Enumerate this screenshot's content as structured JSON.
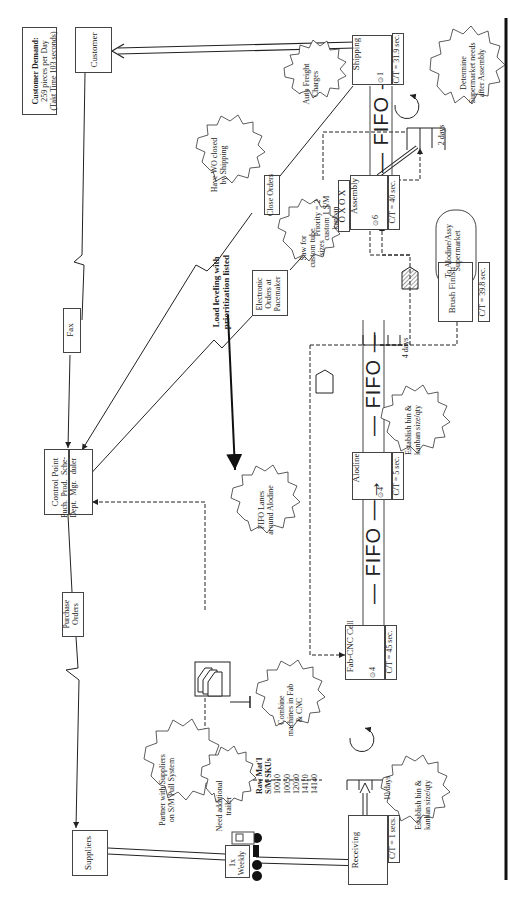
{
  "customer_demand": {
    "title": "Customer Demand:",
    "line1": "259 pieces per Day",
    "line2": "(Takt Time 103 seconds)"
  },
  "entities": {
    "customer": "Customer",
    "suppliers": "Suppliers",
    "control_point": "Control Point",
    "control_cells": [
      "Puch. Dept.",
      "Prod. Mgr.",
      "Sche- duler"
    ]
  },
  "info_boxes": {
    "fax": "Fax",
    "purchase_orders": "Purchase Orders",
    "close_orders": "Close Orders",
    "electronic_orders": "Electronic Orders at Pacemaker"
  },
  "load_leveling": "Load leveling with prioritization listed",
  "processes": [
    {
      "name": "Shipping",
      "operators": "1",
      "ct": "C/T = 31.9 sec."
    },
    {
      "name": "Assembly",
      "operators": "6",
      "ct": "C/T = 40 sec."
    },
    {
      "name": "Brush Finish",
      "ct": "C/T = 39.8 sec."
    },
    {
      "name": "Alodine",
      "operators": "4",
      "ct": "C/T = 5 sec."
    },
    {
      "name": "Fab-CNC Cell",
      "operators": "4",
      "ct": "C/T = 45 sec."
    },
    {
      "name": "Receiving",
      "ct": "C/T = 1 secs."
    }
  ],
  "fifo_label": "FIFO",
  "supermarkets": {
    "shipping": "2 days",
    "alodine": "4 days",
    "raw": "10 days"
  },
  "raw_material": {
    "title": "Raw Mat'l",
    "subtitle": "S/M SKUs",
    "skus": [
      "10010",
      "10050",
      "12030",
      "14110",
      "14140"
    ]
  },
  "priority_note": "Priority = 2 custom 1 S/M kanban",
  "heijunka": "O X O X",
  "supermarket_target": "To Alodine/Assy Supermarket",
  "truck": "1x Weekly",
  "kaizen_bursts": [
    "Auto Freight Charges",
    "Determine Supermarket needs after Assembly",
    "Have WO closed by Shipping",
    "Saw for custom tube sizes",
    "Establish bin & kanban size/qty",
    "FIFO Lanes around Alodine",
    "Combine machines in Fab & CNC",
    "Establish bin & kanban size/qty",
    "Partner with Suppliers on S/M Pull System",
    "Need additional trailer"
  ]
}
